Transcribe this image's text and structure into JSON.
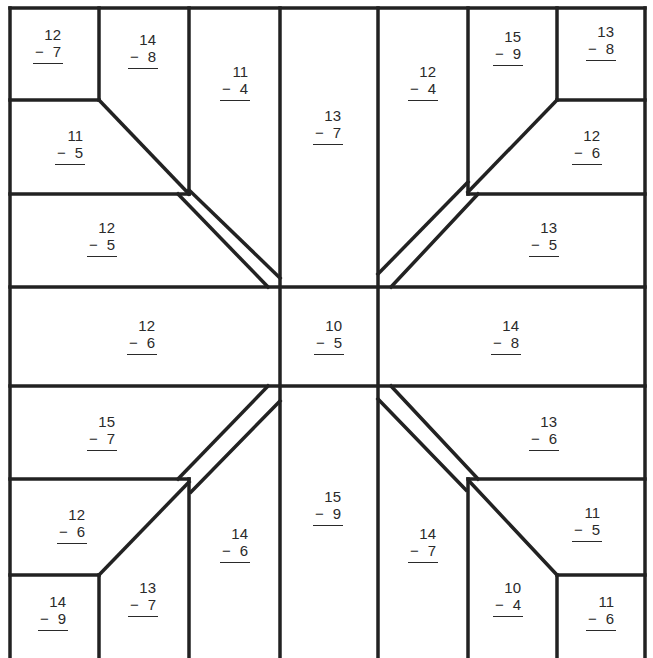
{
  "worksheet": {
    "type": "subtraction quilt puzzle",
    "line_color": "#222222",
    "background": "#ffffff"
  },
  "problems": [
    {
      "id": "tl-corner",
      "minuend": "12",
      "subtrahend": "7",
      "x": 48,
      "y": 45
    },
    {
      "id": "tl-top-a",
      "minuend": "14",
      "subtrahend": "8",
      "x": 143,
      "y": 50
    },
    {
      "id": "tl-top-b",
      "minuend": "11",
      "subtrahend": "4",
      "x": 235,
      "y": 82
    },
    {
      "id": "top-center",
      "minuend": "13",
      "subtrahend": "7",
      "x": 328,
      "y": 126
    },
    {
      "id": "tr-top-b",
      "minuend": "12",
      "subtrahend": "4",
      "x": 423,
      "y": 82
    },
    {
      "id": "tr-top-a",
      "minuend": "15",
      "subtrahend": "9",
      "x": 508,
      "y": 47
    },
    {
      "id": "tr-corner",
      "minuend": "13",
      "subtrahend": "8",
      "x": 601,
      "y": 42
    },
    {
      "id": "tl-side-a",
      "minuend": "11",
      "subtrahend": "5",
      "x": 70,
      "y": 146
    },
    {
      "id": "tr-side-a",
      "minuend": "12",
      "subtrahend": "6",
      "x": 587,
      "y": 146
    },
    {
      "id": "tl-side-b",
      "minuend": "12",
      "subtrahend": "5",
      "x": 102,
      "y": 238
    },
    {
      "id": "tr-side-b",
      "minuend": "13",
      "subtrahend": "5",
      "x": 544,
      "y": 238
    },
    {
      "id": "mid-left",
      "minuend": "12",
      "subtrahend": "6",
      "x": 142,
      "y": 336
    },
    {
      "id": "center",
      "minuend": "10",
      "subtrahend": "5",
      "x": 329,
      "y": 336
    },
    {
      "id": "mid-right",
      "minuend": "14",
      "subtrahend": "8",
      "x": 506,
      "y": 336
    },
    {
      "id": "bl-side-b",
      "minuend": "15",
      "subtrahend": "7",
      "x": 102,
      "y": 432
    },
    {
      "id": "br-side-b",
      "minuend": "13",
      "subtrahend": "6",
      "x": 544,
      "y": 432
    },
    {
      "id": "bl-side-a",
      "minuend": "12",
      "subtrahend": "6",
      "x": 72,
      "y": 525
    },
    {
      "id": "br-side-a",
      "minuend": "11",
      "subtrahend": "5",
      "x": 587,
      "y": 523
    },
    {
      "id": "bottom-center",
      "minuend": "15",
      "subtrahend": "9",
      "x": 328,
      "y": 507
    },
    {
      "id": "bl-bottom-b",
      "minuend": "14",
      "subtrahend": "6",
      "x": 235,
      "y": 544
    },
    {
      "id": "br-bottom-b",
      "minuend": "14",
      "subtrahend": "7",
      "x": 423,
      "y": 544
    },
    {
      "id": "bl-bottom-a",
      "minuend": "13",
      "subtrahend": "7",
      "x": 143,
      "y": 598
    },
    {
      "id": "br-bottom-a",
      "minuend": "10",
      "subtrahend": "4",
      "x": 508,
      "y": 598
    },
    {
      "id": "bl-corner",
      "minuend": "14",
      "subtrahend": "9",
      "x": 53,
      "y": 612
    },
    {
      "id": "br-corner",
      "minuend": "11",
      "subtrahend": "6",
      "x": 601,
      "y": 612
    }
  ],
  "symbols": {
    "minus": "−"
  }
}
